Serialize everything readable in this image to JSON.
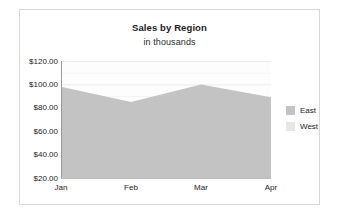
{
  "chart_data": {
    "type": "area",
    "title": "Sales by Region",
    "subtitle": "in thousands",
    "xlabel": "",
    "ylabel": "",
    "categories": [
      "Jan",
      "Feb",
      "Mar",
      "Apr"
    ],
    "series": [
      {
        "name": "East",
        "values": [
          98,
          85,
          100,
          89
        ],
        "color": "#c3c3c3"
      },
      {
        "name": "West",
        "values": [
          0,
          0,
          0,
          0
        ],
        "color": "#e2e2e2"
      }
    ],
    "ylim": [
      20,
      120
    ],
    "yticks": [
      20,
      40,
      60,
      80,
      100,
      120
    ],
    "ytick_labels": [
      "$20.00",
      "$40.00",
      "$60.00",
      "$80.00",
      "$100.00",
      "$120.00"
    ],
    "grid": true,
    "grid_color": "#ececec",
    "legend_position": "right",
    "plot_background": "#fdfdfd"
  },
  "legend": {
    "items": [
      {
        "label": "East",
        "color": "#c3c3c3"
      },
      {
        "label": "West",
        "color": "#e6e6e6"
      }
    ]
  },
  "frame": {
    "border_color": "#d8d8d8",
    "background": "#ffffff"
  }
}
